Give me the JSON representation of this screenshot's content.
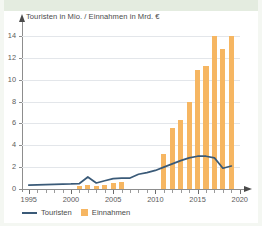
{
  "figure": {
    "title": "Touristen in Mio. / Einnahmen in Mrd. €",
    "accent_bar_color": "#f6b662",
    "accent_line_color": "#3a5a78",
    "band_color": "#e4ece0",
    "grid_color": "#e3e6ea"
  },
  "legend": {
    "items": [
      {
        "label": "Touristen",
        "type": "line",
        "color": "#3a5a78"
      },
      {
        "label": "Einnahmen",
        "type": "bar",
        "color": "#f6b662"
      }
    ]
  },
  "axes": {
    "y_ticks": [
      "0",
      "2",
      "4",
      "6",
      "8",
      "10",
      "12",
      "14"
    ],
    "x_ticks": [
      "1995",
      "2000",
      "2005",
      "2010",
      "2015",
      "2020"
    ]
  },
  "chart_data": {
    "type": "bar",
    "title": "Touristen in Mio. / Einnahmen in Mrd. €",
    "subtitle": "",
    "xlabel": "",
    "ylabel": "Touristen in Mio. / Einnahmen in Mrd. €",
    "xlim": [
      1994.2,
      2020.5
    ],
    "ylim": [
      0,
      15
    ],
    "y_ticks": [
      0,
      2,
      4,
      6,
      8,
      10,
      12,
      14
    ],
    "x_ticks": [
      1995,
      2000,
      2005,
      2010,
      2015,
      2020
    ],
    "grid": "horizontal",
    "legend_position": "bottom-left",
    "x": [
      1995,
      1996,
      1997,
      1998,
      1999,
      2000,
      2001,
      2002,
      2003,
      2004,
      2005,
      2006,
      2007,
      2008,
      2009,
      2010,
      2011,
      2012,
      2013,
      2014,
      2015,
      2016,
      2017,
      2018,
      2019
    ],
    "series": [
      {
        "name": "Einnahmen",
        "type": "bar",
        "unit": "Mrd. €",
        "color": "#f6b662",
        "values": [
          null,
          null,
          null,
          null,
          null,
          null,
          0.3,
          0.35,
          0.25,
          0.4,
          0.55,
          0.6,
          null,
          null,
          null,
          null,
          3.2,
          5.6,
          6.35,
          8.0,
          10.9,
          11.3,
          14.0,
          12.8,
          14.0
        ]
      },
      {
        "name": "Touristen",
        "type": "line",
        "unit": "Mio.",
        "color": "#3a5a78",
        "values": [
          0.35,
          0.38,
          0.4,
          0.42,
          0.44,
          0.46,
          0.5,
          1.1,
          0.55,
          0.75,
          0.95,
          1.0,
          1.0,
          1.35,
          1.5,
          1.7,
          2.0,
          2.3,
          2.6,
          2.85,
          3.0,
          3.0,
          2.85,
          1.9,
          2.1
        ]
      }
    ]
  }
}
